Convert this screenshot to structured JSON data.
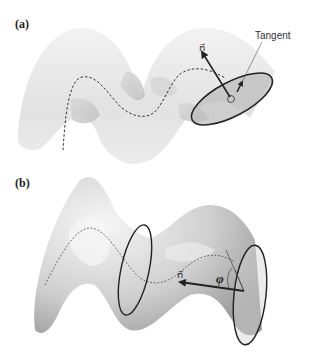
{
  "figure": {
    "panels": [
      {
        "label": "(a)",
        "annotations": {
          "normal_vector": "n⃗",
          "tangent_label": "Tangent"
        },
        "description": "Helical ribbon surface with dashed path and tilted elliptical cross-section disk with normal vector"
      },
      {
        "label": "(b)",
        "annotations": {
          "normal_vector": "n⃗",
          "angle_label": "φ"
        },
        "description": "Wavy tube surface with dashed centerline, two ring cross-sections, normal vector and angle phi"
      }
    ],
    "colors": {
      "surface_light": "#ececec",
      "surface_mid": "#c9c9c9",
      "surface_dark": "#9a9a9a",
      "line": "#222222",
      "disk_fill": "#b8b8b8"
    }
  }
}
